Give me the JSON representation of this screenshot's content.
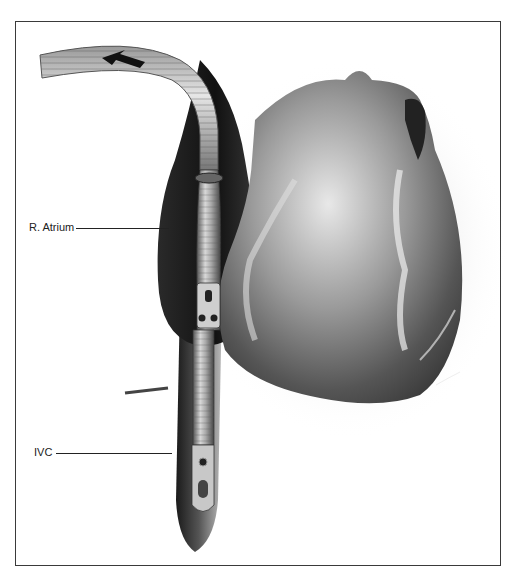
{
  "figure": {
    "labels": [
      {
        "id": "r-atrium",
        "text": "R. Atrium"
      },
      {
        "id": "ivc",
        "text": "IVC"
      }
    ],
    "flow_direction_icon": "arrow-left-icon",
    "colors": {
      "ink": "#222222",
      "frame": "#3a3a3a",
      "background": "#ffffff"
    }
  }
}
